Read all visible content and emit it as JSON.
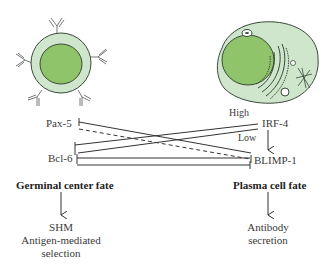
{
  "cells": {
    "left": {
      "name": "germinal-center-b-cell"
    },
    "right": {
      "name": "plasma-cell"
    }
  },
  "genes": {
    "pax5": "Pax-5",
    "bcl6": "Bcl-6",
    "irf4": "IRF-4",
    "blimp1": "BLIMP-1"
  },
  "irf4_levels": {
    "high": "High",
    "low": "Low"
  },
  "fates": {
    "germinal_center": {
      "title": "Germinal center fate",
      "outcome_line1": "SHM",
      "outcome_line2": "Antigen-mediated",
      "outcome_line3": "selection"
    },
    "plasma_cell": {
      "title": "Plasma cell fate",
      "outcome_line1": "Antibody",
      "outcome_line2": "secretion"
    }
  },
  "colors": {
    "cytoplasm": "#cfe5cc",
    "nucleus": "#8fc46a",
    "outline": "#3a4a3a",
    "line": "#333333"
  }
}
